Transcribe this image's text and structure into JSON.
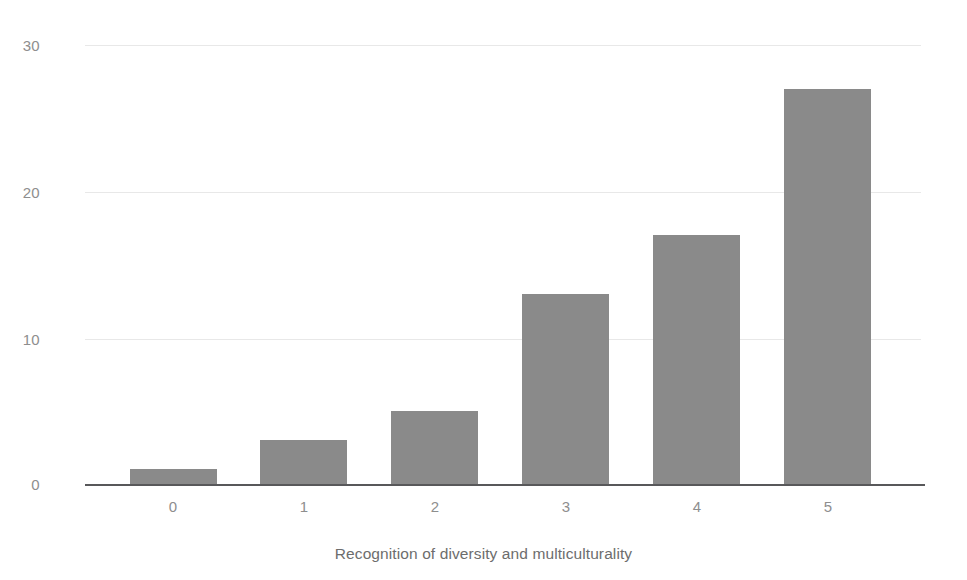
{
  "chart_data": {
    "type": "bar",
    "title": "",
    "subtitle": "",
    "xlabel": "Recognition of diversity and multiculturality",
    "ylabel": "",
    "categories": [
      "0",
      "1",
      "2",
      "3",
      "4",
      "5"
    ],
    "values": [
      1,
      3,
      5,
      13,
      17,
      27
    ],
    "series": [
      {
        "name": "count",
        "values": [
          1,
          3,
          5,
          13,
          17,
          27
        ]
      }
    ],
    "ylim": [
      0,
      30
    ],
    "yticks": [
      "0",
      "10",
      "20",
      "30"
    ],
    "ytick_values": [
      0,
      10,
      20,
      30
    ],
    "xticks": [
      "0",
      "1",
      "2",
      "3",
      "4",
      "5"
    ],
    "grid": "horizontal",
    "legend": "none",
    "bar_color": "#8a8a8a",
    "grid_color": "#e8e8e8",
    "axis_color": "#58585a",
    "tick_label_color": "#8e8e8e",
    "axis_title_color": "#6d6d6d",
    "background_color": "#ffffff"
  }
}
